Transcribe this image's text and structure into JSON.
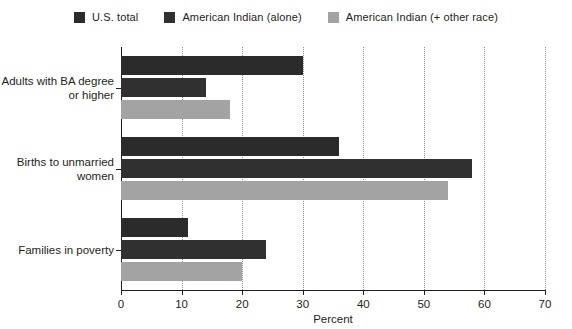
{
  "chart_data": {
    "type": "bar",
    "orientation": "horizontal",
    "title": "",
    "xlabel": "Percent",
    "ylabel": "",
    "xlim": [
      0,
      70
    ],
    "xticks": [
      0,
      10,
      20,
      30,
      40,
      50,
      60,
      70
    ],
    "grid": "vertical-dotted",
    "legend_position": "top-center",
    "categories": [
      "Adults with BA degree or higher",
      "Births to unmarried women",
      "Families in poverty"
    ],
    "category_lines": [
      [
        "Adults with BA degree",
        "or higher"
      ],
      [
        "Births to unmarried",
        "women"
      ],
      [
        "Families in poverty"
      ]
    ],
    "series": [
      {
        "name": "U.S. total",
        "color": "#2b2b2b",
        "values": [
          30,
          36,
          11
        ]
      },
      {
        "name": "American Indian (alone)",
        "color": "#303030",
        "values": [
          14,
          58,
          24
        ]
      },
      {
        "name": "American Indian (+ other race)",
        "color": "#a3a3a3",
        "values": [
          18,
          54,
          20
        ]
      }
    ]
  },
  "legend": {
    "items": [
      {
        "label": "U.S. total",
        "color": "#2b2b2b"
      },
      {
        "label": "American Indian (alone)",
        "color": "#303030"
      },
      {
        "label": "American Indian (+ other race)",
        "color": "#a3a3a3"
      }
    ]
  },
  "axis": {
    "x_title": "Percent",
    "x_tick_labels": [
      "0",
      "10",
      "20",
      "30",
      "40",
      "50",
      "60",
      "70"
    ]
  },
  "colors": {
    "axis": "#231f20",
    "gridline": "#8d8d8d",
    "background": "#ffffff",
    "text": "#231f20"
  }
}
